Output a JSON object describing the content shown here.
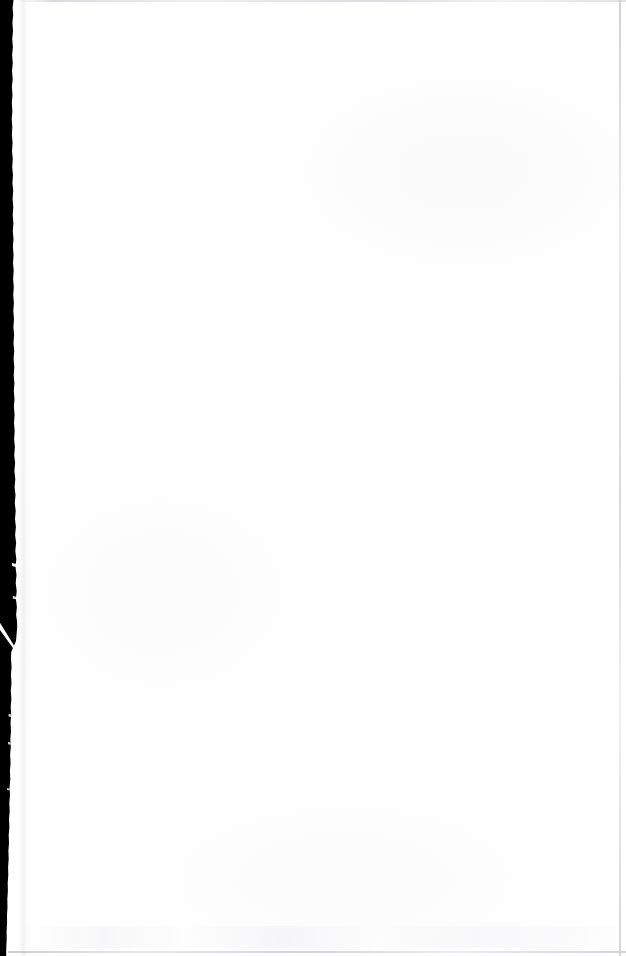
{
  "document": {
    "kind": "scanned-page",
    "page_content": "",
    "is_blank": true,
    "width_px": 626,
    "height_px": 956
  },
  "page": {
    "background_color": "#ffffff",
    "paper_tint": "#fdfdfe"
  },
  "scan_artifacts": {
    "gutter": {
      "label": "",
      "color": "#000000",
      "side": "left",
      "description": "",
      "top_width_px": 13,
      "max_width_px": 17,
      "bottom_width_px": 6
    },
    "tear_slash": {
      "label": "",
      "color": "#ffffff",
      "start_x": 0,
      "start_y": 625,
      "end_x": 17,
      "end_y": 650
    },
    "border_lines": {
      "top_color": "#d6d6db",
      "right_color": "#ced0d6",
      "bottom_color": "#c8c8ce",
      "right_x": 619,
      "bottom_y": 951
    }
  }
}
